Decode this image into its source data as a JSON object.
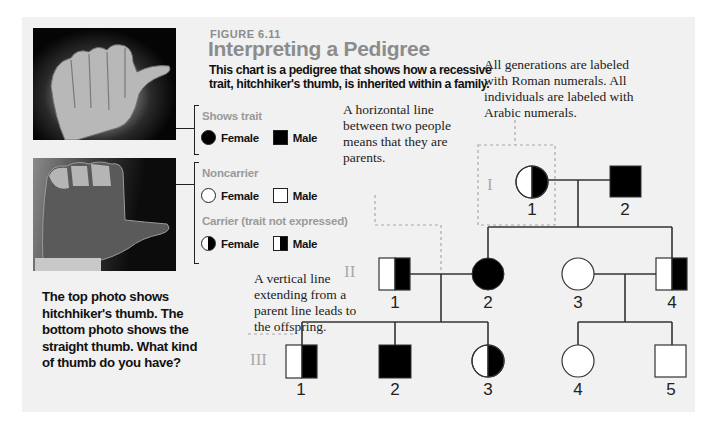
{
  "figure": {
    "label": "FIGURE 6.11",
    "title": "Interpreting a Pedigree",
    "description": "This chart is a pedigree that shows how a recessive trait, hitchhiker's thumb, is inherited within a family."
  },
  "photos": {
    "top": "hitchhiker-thumb-photo",
    "bottom": "straight-thumb-photo",
    "caption": "The top photo shows hitchhiker's thumb. The bottom photo shows the straight thumb. What kind of thumb do you have?"
  },
  "legend": {
    "shows_trait": {
      "heading": "Shows trait",
      "female": "Female",
      "male": "Male"
    },
    "noncarrier": {
      "heading": "Noncarrier",
      "female": "Female",
      "male": "Male"
    },
    "carrier": {
      "heading": "Carrier (trait not expressed)",
      "female": "Female",
      "male": "Male"
    }
  },
  "callouts": {
    "generations": "All generations are labeled with Roman numerals. All individuals are labeled with Arabic numerals.",
    "horizontal": "A horizontal line between two people means that they are parents.",
    "vertical": "A vertical line extending from a parent line leads to the offspring."
  },
  "pedigree": {
    "colors": {
      "affected": "#000000",
      "unaffected": "#ffffff",
      "line": "#333333"
    },
    "generations": [
      {
        "roman": "I",
        "individuals": [
          {
            "id": "1",
            "sex": "female",
            "status": "carrier"
          },
          {
            "id": "2",
            "sex": "male",
            "status": "affected"
          }
        ]
      },
      {
        "roman": "II",
        "individuals": [
          {
            "id": "1",
            "sex": "male",
            "status": "carrier"
          },
          {
            "id": "2",
            "sex": "female",
            "status": "affected"
          },
          {
            "id": "3",
            "sex": "female",
            "status": "noncarrier"
          },
          {
            "id": "4",
            "sex": "male",
            "status": "carrier"
          }
        ]
      },
      {
        "roman": "III",
        "individuals": [
          {
            "id": "1",
            "sex": "male",
            "status": "carrier"
          },
          {
            "id": "2",
            "sex": "male",
            "status": "affected"
          },
          {
            "id": "3",
            "sex": "female",
            "status": "carrier"
          },
          {
            "id": "4",
            "sex": "female",
            "status": "noncarrier"
          },
          {
            "id": "5",
            "sex": "male",
            "status": "noncarrier"
          }
        ]
      }
    ]
  }
}
